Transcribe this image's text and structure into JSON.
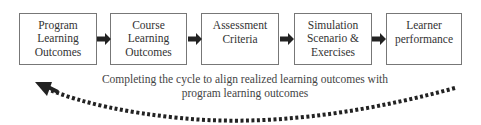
{
  "diagram": {
    "boxes": [
      {
        "label": "Program Learning Outcomes"
      },
      {
        "label": "Course Learning Outcomes"
      },
      {
        "label": "Assessment Criteria"
      },
      {
        "label": "Simulation Scenario & Exercises"
      },
      {
        "label": "Learner performance"
      }
    ],
    "feedback_caption_line1": "Completing the cycle to align realized learning outcomes with",
    "feedback_caption_line2": "program learning outcomes",
    "colors": {
      "border": "#777777",
      "arrow": "#222222",
      "text": "#333333"
    }
  }
}
